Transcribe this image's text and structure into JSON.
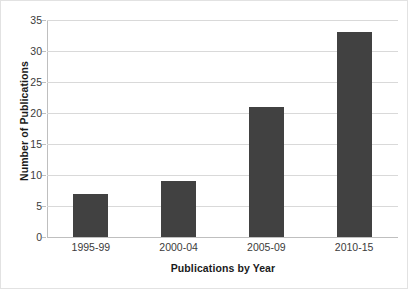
{
  "chart_data": {
    "type": "bar",
    "title": "",
    "xlabel": "Publications by Year",
    "ylabel": "Number of Publications",
    "categories": [
      "1995-99",
      "2000-04",
      "2005-09",
      "2010-15"
    ],
    "values": [
      7,
      9,
      21,
      33
    ],
    "ylim": [
      0,
      35
    ],
    "ytick_labels": [
      "0",
      "5",
      "10",
      "15",
      "20",
      "25",
      "30",
      "35"
    ],
    "ytick_values": [
      0,
      5,
      10,
      15,
      20,
      25,
      30,
      35
    ],
    "grid": "horizontal",
    "legend": "none",
    "series": [
      {
        "name": "Number of Publications",
        "values": [
          7,
          9,
          21,
          33
        ]
      }
    ],
    "colors": {
      "bar_fill": "#414141",
      "gridline": "#d9d9d9",
      "axis_line": "#bfbfbf",
      "tick_text": "#3b3b3b",
      "title_text": "#1a1a1a",
      "background": "#ffffff",
      "frame_border": "#e2e2e2"
    }
  }
}
